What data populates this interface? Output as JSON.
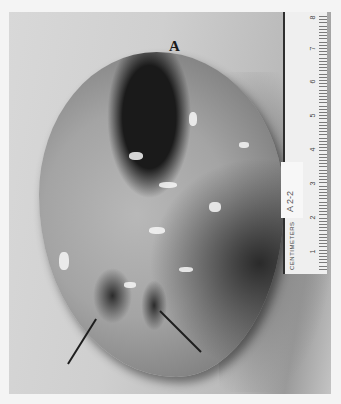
{
  "image": {
    "description": "Grayscale gross pathology photograph of a resected specimen with a centimeter ruler",
    "panel_label": "A",
    "ruler": {
      "units_label": "CENTIMETERS",
      "tag_text": "A 2-2",
      "numbers": [
        "1",
        "2",
        "3",
        "4",
        "5",
        "6",
        "7",
        "8"
      ]
    },
    "annotations": {
      "arrows": 2,
      "arrow_description": "Two black pointer lines indicating structures near the lower pole of the specimen"
    }
  }
}
